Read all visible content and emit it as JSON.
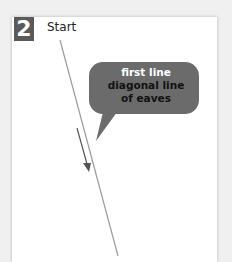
{
  "step": {
    "number": "2",
    "label": "Start"
  },
  "callout": {
    "line1": "first line",
    "line2": "diagonal line",
    "line3": "of eaves",
    "fill_color": "#6b6b6b"
  },
  "colors": {
    "badge": "#5a5a5a",
    "line": "#9a9a9a",
    "arrow": "#555555"
  }
}
